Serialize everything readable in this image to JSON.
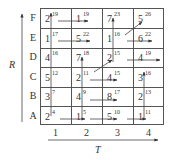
{
  "axes": {
    "y_label": "R",
    "x_label": "T",
    "rows": [
      "F",
      "E",
      "D",
      "C",
      "B",
      "A"
    ],
    "cols": [
      "1",
      "2",
      "3",
      "4"
    ]
  },
  "grid": [
    [
      {
        "v": "2",
        "s": "19"
      },
      {
        "v": "1",
        "s": "19"
      },
      {
        "v": "7",
        "s": "23"
      },
      {
        "v": "5",
        "s": "26"
      }
    ],
    [
      {
        "v": "1",
        "s": "17"
      },
      {
        "v": "5",
        "s": "22"
      },
      {
        "v": "1",
        "s": "16"
      },
      {
        "v": "6",
        "s": "22"
      }
    ],
    [
      {
        "v": "4",
        "s": "16"
      },
      {
        "v": "7",
        "s": "18"
      },
      {
        "v": "2",
        "s": "15"
      },
      {
        "v": "4",
        "s": "19"
      }
    ],
    [
      {
        "v": "5",
        "s": "12"
      },
      {
        "v": "2",
        "s": "11"
      },
      {
        "v": "4",
        "s": "15"
      },
      {
        "v": "3",
        "s": "16"
      }
    ],
    [
      {
        "v": "3",
        "s": "7"
      },
      {
        "v": "4",
        "s": "9"
      },
      {
        "v": "8",
        "s": "17"
      },
      {
        "v": "2",
        "s": "13"
      }
    ],
    [
      {
        "v": "2",
        "s": "4"
      },
      {
        "v": "1",
        "s": "5"
      },
      {
        "v": "5",
        "s": "10"
      },
      {
        "v": "1",
        "s": "11"
      }
    ]
  ],
  "colors": {
    "line": "#555555",
    "text": "#333333"
  }
}
